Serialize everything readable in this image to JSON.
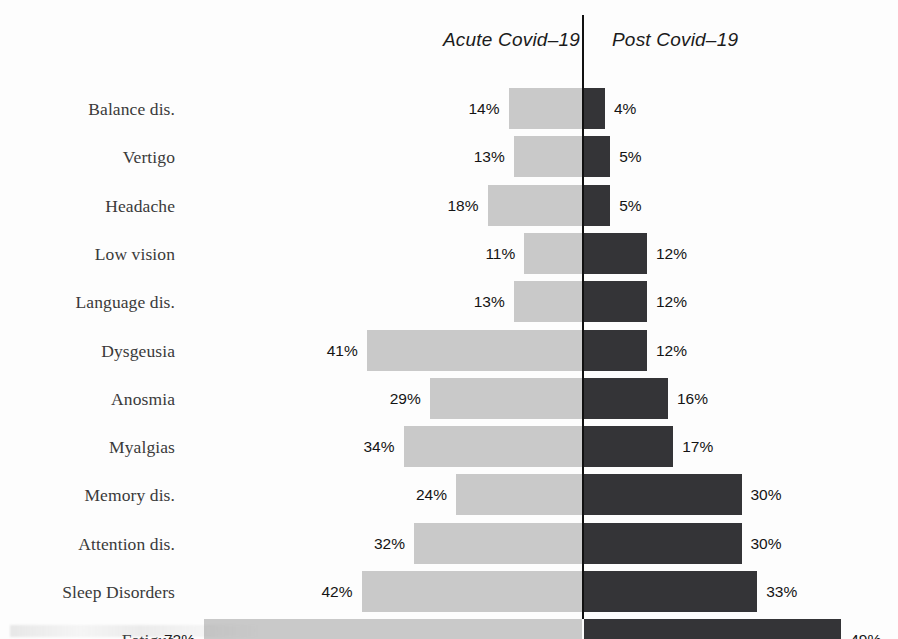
{
  "headers": {
    "left": "Acute Covid–19",
    "right": "Post Covid–19"
  },
  "colors": {
    "acute_bar": "#c9c9c9",
    "post_bar": "#343437",
    "axis": "#111111",
    "label_text": "#3a3a3a",
    "value_text": "#141414",
    "background": "#fdfdfd"
  },
  "chart_data": {
    "type": "bar",
    "title": "",
    "subtitle": "",
    "xlabel": "",
    "ylabel": "",
    "orientation": "horizontal",
    "layout": "diverging-tornado",
    "grid": false,
    "legend_position": "top",
    "axis_center_value": 0,
    "value_unit": "%",
    "xlim": [
      0,
      72
    ],
    "categories": [
      "Balance dis.",
      "Vertigo",
      "Headache",
      "Low vision",
      "Language dis.",
      "Dysgeusia",
      "Anosmia",
      "Myalgias",
      "Memory dis.",
      "Attention dis.",
      "Sleep Disorders",
      "Fatigue"
    ],
    "series": [
      {
        "name": "Acute Covid–19",
        "side": "left",
        "color": "#c9c9c9",
        "values": [
          14,
          13,
          18,
          11,
          13,
          41,
          29,
          34,
          24,
          32,
          42,
          72
        ],
        "labels": [
          "14%",
          "13%",
          "18%",
          "11%",
          "13%",
          "41%",
          "29%",
          "34%",
          "24%",
          "32%",
          "42%",
          "72%"
        ]
      },
      {
        "name": "Post Covid–19",
        "side": "right",
        "color": "#343437",
        "values": [
          4,
          5,
          5,
          12,
          12,
          12,
          16,
          17,
          30,
          30,
          33,
          49
        ],
        "labels": [
          "4%",
          "5%",
          "5%",
          "12%",
          "12%",
          "12%",
          "16%",
          "17%",
          "30%",
          "30%",
          "33%",
          "49%"
        ]
      }
    ]
  }
}
